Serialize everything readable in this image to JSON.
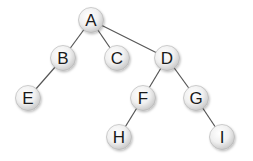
{
  "diagram": {
    "type": "tree",
    "colors": {
      "edge": "#555555",
      "node_fill_light": "#ffffff",
      "node_fill_dark": "#c8c8c8",
      "node_stroke": "#b0b0b0",
      "label": "#1a1a1a"
    },
    "nodes": [
      {
        "id": "A",
        "label": "A",
        "x": 91,
        "y": 20
      },
      {
        "id": "B",
        "label": "B",
        "x": 63,
        "y": 58
      },
      {
        "id": "C",
        "label": "C",
        "x": 117,
        "y": 58
      },
      {
        "id": "D",
        "label": "D",
        "x": 167,
        "y": 58
      },
      {
        "id": "E",
        "label": "E",
        "x": 28,
        "y": 98
      },
      {
        "id": "F",
        "label": "F",
        "x": 143,
        "y": 98
      },
      {
        "id": "G",
        "label": "G",
        "x": 196,
        "y": 98
      },
      {
        "id": "H",
        "label": "H",
        "x": 119,
        "y": 137
      },
      {
        "id": "I",
        "label": "I",
        "x": 222,
        "y": 137
      }
    ],
    "edges": [
      [
        "A",
        "B"
      ],
      [
        "A",
        "C"
      ],
      [
        "A",
        "D"
      ],
      [
        "B",
        "E"
      ],
      [
        "D",
        "F"
      ],
      [
        "D",
        "G"
      ],
      [
        "F",
        "H"
      ],
      [
        "G",
        "I"
      ]
    ]
  }
}
